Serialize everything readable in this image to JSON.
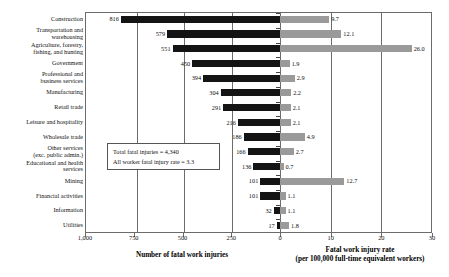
{
  "chart_data": {
    "type": "bar",
    "orientation": "horizontal-bidirectional",
    "categories": [
      "Construction",
      "Transportation and\nwarehousing",
      "Agriculture, forestry,\nfishing, and hunting",
      "Government",
      "Professional and\nbusiness services",
      "Manufacturing",
      "Retail trade",
      "Leisure and hospitality",
      "Wholesale trade",
      "Other services\n(exc. public admin.)",
      "Educational and health\nservices",
      "Mining",
      "Financial activities",
      "Information",
      "Utilities"
    ],
    "series": [
      {
        "name": "Number of fatal work injuries",
        "color": "#141414",
        "side": "left",
        "values": [
          816,
          579,
          551,
          450,
          394,
          304,
          291,
          216,
          186,
          166,
          136,
          101,
          101,
          32,
          17
        ],
        "labels": [
          "816",
          "579",
          "551",
          "450",
          "394",
          "304",
          "291",
          "216",
          "186",
          "166",
          "136",
          "101",
          "101",
          "32",
          "17"
        ],
        "axis_title": "Number of fatal work injuries",
        "ticks": [
          1000,
          750,
          500,
          250,
          0
        ],
        "tick_labels": [
          "1,000",
          "750",
          "500",
          "250",
          "0"
        ],
        "lim": [
          1000,
          0
        ]
      },
      {
        "name": "Fatal work injury rate",
        "color": "#9a9a9a",
        "side": "right",
        "values": [
          9.7,
          12.1,
          26.0,
          1.9,
          2.9,
          2.2,
          2.1,
          2.1,
          4.9,
          2.7,
          0.7,
          12.7,
          1.1,
          1.1,
          1.8
        ],
        "labels": [
          "9.7",
          "12.1",
          "26.0",
          "1.9",
          "2.9",
          "2.2",
          "2.1",
          "2.1",
          "4.9",
          "2.7",
          "0.7",
          "12.7",
          "1.1",
          "1.1",
          "1.8"
        ],
        "axis_title": "Fatal work injury rate\n(per 100,000 full-time equivalent workers)",
        "ticks": [
          0,
          10,
          20,
          30
        ],
        "tick_labels": [
          "0",
          "10",
          "20",
          "30"
        ],
        "lim": [
          0,
          30
        ]
      }
    ],
    "annotation": {
      "line1": "Total fatal injuries = 4,340",
      "line2": "All worker fatal injury rate = 3.3"
    },
    "title": "",
    "grid": true,
    "legend": "none"
  }
}
